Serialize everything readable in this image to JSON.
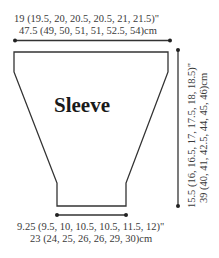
{
  "diagram": {
    "piece_label": "Sleeve",
    "width_top": {
      "inches": "19 (19.5, 20, 20.5, 20.5, 21, 21.5)\"",
      "cm": "47.5 (49, 50, 51, 51, 52.5, 54)cm"
    },
    "width_bottom": {
      "inches": "9.25 (9.5, 10, 10.5, 10.5, 11.5, 12)\"",
      "cm": "23 (24, 25, 26, 26, 29, 30)cm"
    },
    "length": {
      "inches": "15.5 (16, 16.5, 17, 17.5, 18, 18.5)\"",
      "cm": "39 (40, 41, 42.5, 44, 45, 46)cm"
    },
    "colors": {
      "line": "#333333",
      "text": "#3a3a3a"
    }
  }
}
